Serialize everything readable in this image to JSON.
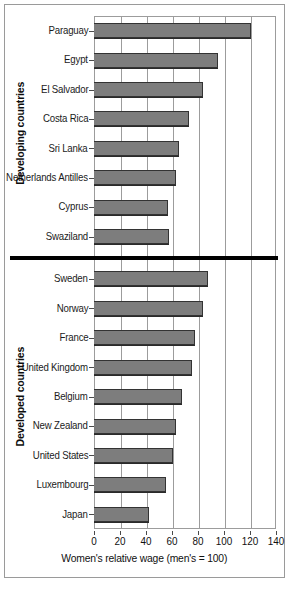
{
  "chart_data": {
    "type": "bar",
    "orientation": "horizontal",
    "title": "",
    "subtitle": "",
    "xlabel": "Women's relative wage (men's = 100)",
    "ylabel": "",
    "xlim": [
      0,
      140
    ],
    "xticks": [
      0,
      20,
      40,
      60,
      80,
      100,
      120,
      140
    ],
    "xtick_labels": [
      "0",
      "20",
      "40",
      "60",
      "80",
      "100",
      "120",
      "140"
    ],
    "grid": "vertical",
    "legend": "none",
    "bar_color": "#7d7d7d",
    "bar_edge_color": "#333333",
    "divider_color": "#000000",
    "groups": [
      {
        "name": "Developing countries",
        "label": "Developing countries",
        "categories": [
          "Paraguay",
          "Egypt",
          "El Salvador",
          "Costa Rica",
          "Sri Lanka",
          "Netherlands Antilles",
          "Cyprus",
          "Swaziland"
        ],
        "values": [
          121,
          95,
          84,
          73,
          65,
          63,
          57,
          58
        ]
      },
      {
        "name": "Developed countries",
        "label": "Developed countries",
        "categories": [
          "Sweden",
          "Norway",
          "France",
          "United Kingdom",
          "Belgium",
          "New Zealand",
          "United States",
          "Luxembourg",
          "Japan"
        ],
        "values": [
          88,
          84,
          78,
          75,
          68,
          63,
          61,
          55,
          42
        ]
      }
    ],
    "categories": [
      "Paraguay",
      "Egypt",
      "El Salvador",
      "Costa Rica",
      "Sri Lanka",
      "Netherlands Antilles",
      "Cyprus",
      "Swaziland",
      "Sweden",
      "Norway",
      "France",
      "United Kingdom",
      "Belgium",
      "New Zealand",
      "United States",
      "Luxembourg",
      "Japan"
    ],
    "values": [
      121,
      95,
      84,
      73,
      65,
      63,
      57,
      58,
      88,
      84,
      78,
      75,
      68,
      63,
      61,
      55,
      42
    ]
  }
}
